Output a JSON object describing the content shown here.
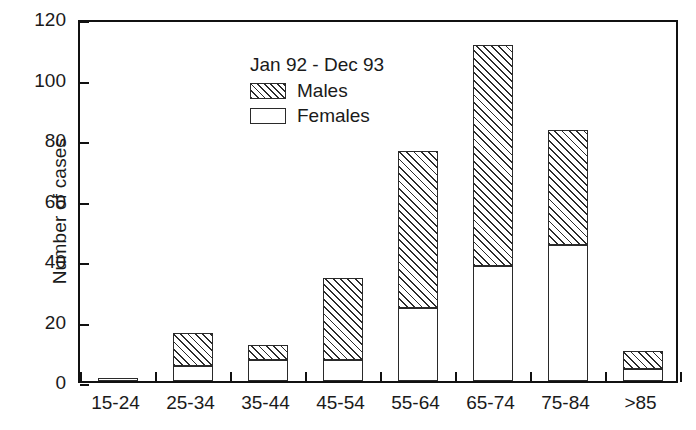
{
  "chart_data": {
    "type": "bar",
    "title": "",
    "subtitle": "",
    "annotation": "Jan 92 - Dec 93",
    "xlabel": "",
    "ylabel": "Number of cases",
    "categories": [
      "15-24",
      "25-34",
      "35-44",
      "45-54",
      "55-64",
      "65-74",
      "75-84",
      ">85"
    ],
    "series": [
      {
        "name": "Females",
        "values": [
          1,
          5,
          7,
          7,
          24,
          38,
          45,
          4
        ]
      },
      {
        "name": "Males",
        "values": [
          0,
          11,
          5,
          27,
          52,
          73,
          38,
          6
        ]
      }
    ],
    "totals": [
      1,
      16,
      12,
      34,
      76,
      111,
      83,
      10
    ],
    "stacked": true,
    "ylim": [
      0,
      120
    ],
    "yticks": [
      0,
      20,
      40,
      60,
      80,
      100,
      120
    ],
    "ytick_labels": [
      "0",
      "20",
      "40",
      "60",
      "80",
      "100",
      "120"
    ],
    "grid": false,
    "legend_position": "top-left-inside"
  },
  "legend": {
    "title": "Jan 92 - Dec 93",
    "entries": [
      {
        "label": "Males",
        "fill": "hatched"
      },
      {
        "label": "Females",
        "fill": "white"
      }
    ]
  },
  "colors": {
    "axis": "#111111",
    "bar_outline": "#2a2a2a",
    "hatch": "#2b2b2b",
    "female_fill": "#ffffff",
    "background": "#ffffff",
    "text": "#1a1a1a"
  }
}
